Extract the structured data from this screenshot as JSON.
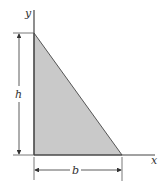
{
  "diagram": {
    "type": "right-triangle-area",
    "labels": {
      "y_axis": "y",
      "x_axis": "x",
      "height": "h",
      "base": "b"
    },
    "colors": {
      "fill": "#c9c9c9",
      "stroke": "#444444"
    }
  }
}
